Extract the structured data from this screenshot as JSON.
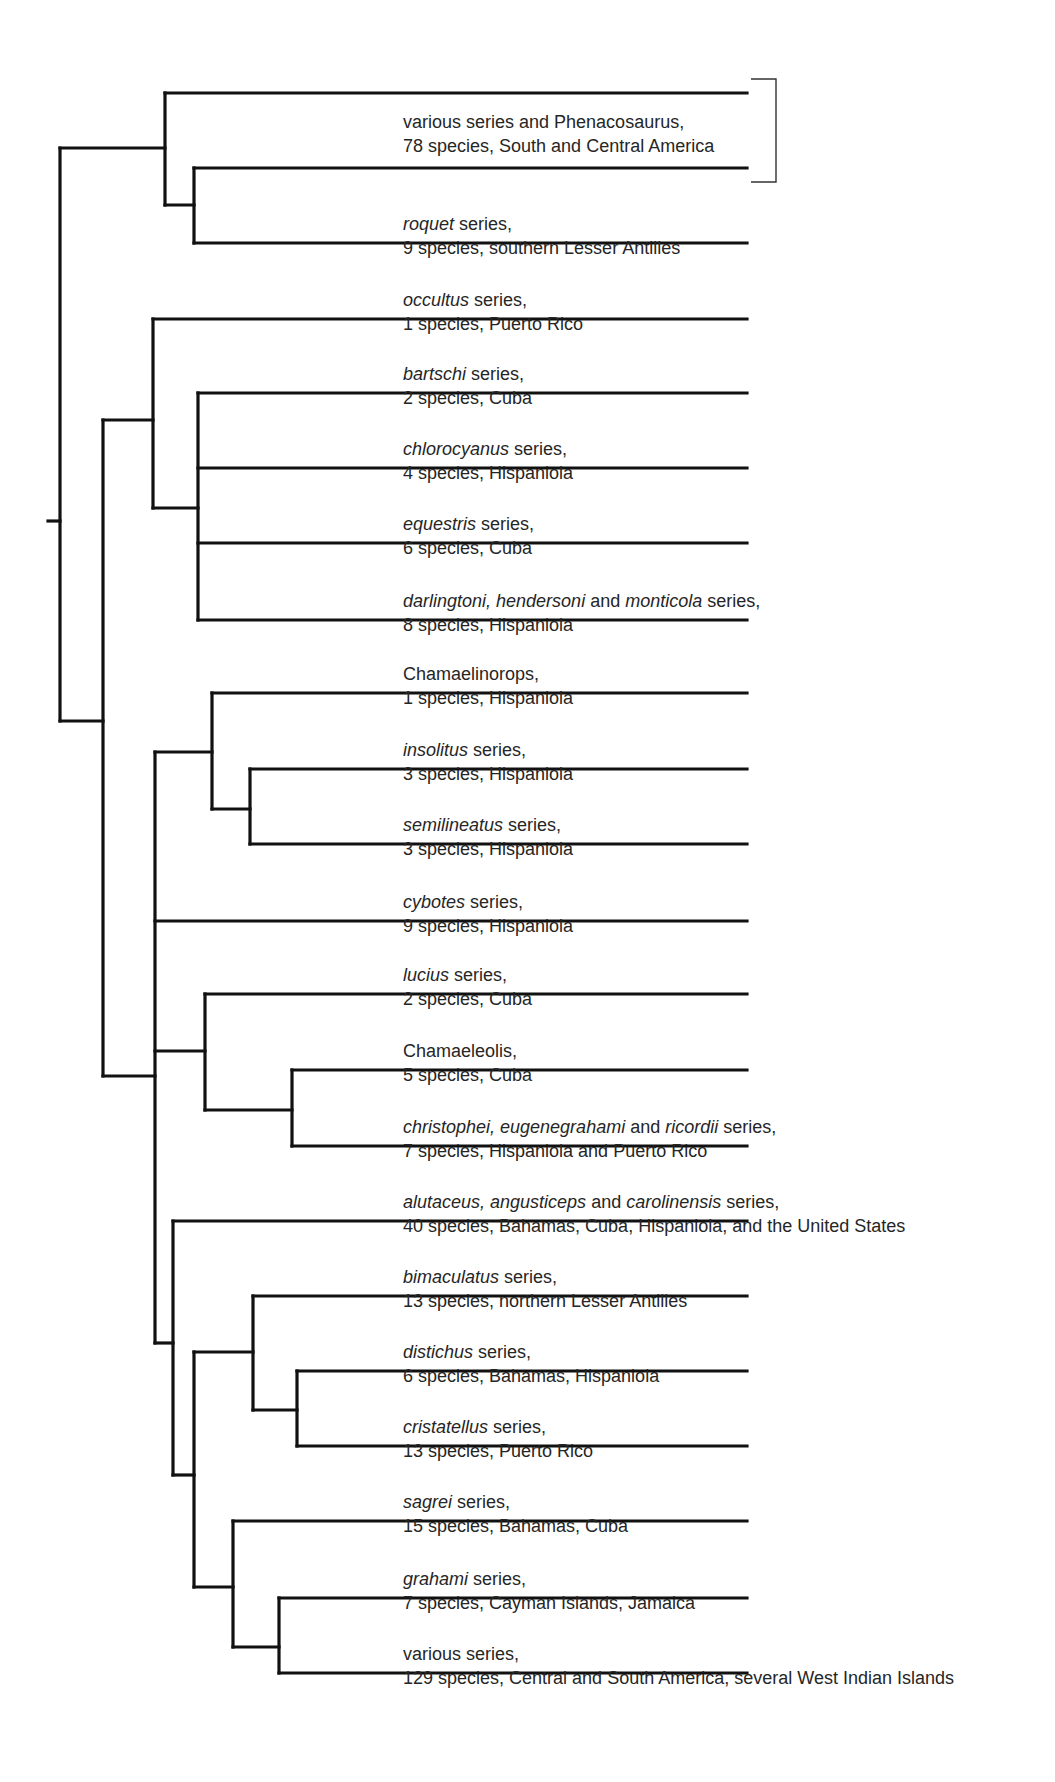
{
  "diagram": {
    "type": "phylogenetic-tree",
    "line_color": "#111111",
    "text_color": "#262626",
    "leaf_end_x": 747,
    "root_stub": {
      "x1": 48,
      "x2": 60,
      "y": 521
    },
    "bracket": {
      "x_left": 751,
      "x_right": 776,
      "y_top": 79,
      "y_bottom": 182,
      "label": "various series and Phenacosaurus clade"
    },
    "nodes": [
      {
        "id": "root",
        "x": 60,
        "y1": 148,
        "y2": 721
      },
      {
        "id": "A",
        "x": 165,
        "y1": 93,
        "y2": 205,
        "parent_x": 60,
        "parent_y": 148
      },
      {
        "id": "B",
        "x": 194,
        "y1": 168,
        "y2": 243,
        "parent_x": 165,
        "parent_y": 205
      },
      {
        "id": "D",
        "x": 103,
        "y1": 420,
        "y2": 1076,
        "parent_x": 60,
        "parent_y": 721
      },
      {
        "id": "C",
        "x": 153,
        "y1": 319,
        "y2": 508,
        "parent_x": 103,
        "parent_y": 420
      },
      {
        "id": "E",
        "x": 198,
        "y1": 393,
        "y2": 620,
        "parent_x": 153,
        "parent_y": 508
      },
      {
        "id": "F",
        "x": 155,
        "y1": 752,
        "y2": 1343,
        "parent_x": 103,
        "parent_y": 1076
      },
      {
        "id": "G",
        "x": 212,
        "y1": 693,
        "y2": 809,
        "parent_x": 155,
        "parent_y": 752
      },
      {
        "id": "H",
        "x": 250,
        "y1": 769,
        "y2": 844,
        "parent_x": 212,
        "parent_y": 809
      },
      {
        "id": "I",
        "x": 205,
        "y1": 994,
        "y2": 1110,
        "parent_x": 155,
        "parent_y": 1051
      },
      {
        "id": "J",
        "x": 292,
        "y1": 1070,
        "y2": 1146,
        "parent_x": 205,
        "parent_y": 1110
      },
      {
        "id": "K",
        "x": 173,
        "y1": 1221,
        "y2": 1475,
        "parent_x": 155,
        "parent_y": 1343
      },
      {
        "id": "M",
        "x": 194,
        "y1": 1352,
        "y2": 1587,
        "parent_x": 173,
        "parent_y": 1475
      },
      {
        "id": "L",
        "x": 253,
        "y1": 1296,
        "y2": 1410,
        "parent_x": 194,
        "parent_y": 1352
      },
      {
        "id": "N",
        "x": 297,
        "y1": 1371,
        "y2": 1446,
        "parent_x": 253,
        "parent_y": 1410
      },
      {
        "id": "O",
        "x": 233,
        "y1": 1521,
        "y2": 1647,
        "parent_x": 194,
        "parent_y": 1587
      },
      {
        "id": "P",
        "x": 279,
        "y1": 1598,
        "y2": 1673,
        "parent_x": 233,
        "parent_y": 1647
      }
    ],
    "leaves": [
      {
        "x": 165,
        "y": 93,
        "label_top": null,
        "line1": null,
        "line2": null
      },
      {
        "x": 194,
        "y": 168,
        "label_top": 110,
        "line1": [
          {
            "t": "various series and Phenacosaurus,",
            "i": false
          }
        ],
        "line2": "78 species, South and Central America"
      },
      {
        "x": 194,
        "y": 243,
        "label_top": 212,
        "line1": [
          {
            "t": "roquet",
            "i": true
          },
          {
            "t": " series,",
            "i": false
          }
        ],
        "line2": "9 species, southern Lesser Antilles"
      },
      {
        "x": 153,
        "y": 319,
        "label_top": 288,
        "line1": [
          {
            "t": "occultus",
            "i": true
          },
          {
            "t": " series,",
            "i": false
          }
        ],
        "line2": "1 species, Puerto Rico"
      },
      {
        "x": 198,
        "y": 393,
        "label_top": 362,
        "line1": [
          {
            "t": "bartschi",
            "i": true
          },
          {
            "t": " series,",
            "i": false
          }
        ],
        "line2": "2 species, Cuba"
      },
      {
        "x": 198,
        "y": 468,
        "label_top": 437,
        "line1": [
          {
            "t": "chlorocyanus",
            "i": true
          },
          {
            "t": " series,",
            "i": false
          }
        ],
        "line2": "4 species, Hispaniola"
      },
      {
        "x": 198,
        "y": 543,
        "label_top": 512,
        "line1": [
          {
            "t": "equestris",
            "i": true
          },
          {
            "t": " series,",
            "i": false
          }
        ],
        "line2": "6 species, Cuba"
      },
      {
        "x": 198,
        "y": 620,
        "label_top": 589,
        "line1": [
          {
            "t": "darlingtoni, hendersoni",
            "i": true
          },
          {
            "t": " and ",
            "i": false
          },
          {
            "t": "monticola",
            "i": true
          },
          {
            "t": " series,",
            "i": false
          }
        ],
        "line2": "8 species, Hispaniola"
      },
      {
        "x": 212,
        "y": 693,
        "label_top": 662,
        "line1": [
          {
            "t": "Chamaelinorops,",
            "i": false
          }
        ],
        "line2": "1 species, Hispaniola"
      },
      {
        "x": 250,
        "y": 769,
        "label_top": 738,
        "line1": [
          {
            "t": "insolitus",
            "i": true
          },
          {
            "t": " series,",
            "i": false
          }
        ],
        "line2": "3 species, Hispaniola"
      },
      {
        "x": 250,
        "y": 844,
        "label_top": 813,
        "line1": [
          {
            "t": "semilineatus",
            "i": true
          },
          {
            "t": " series,",
            "i": false
          }
        ],
        "line2": "3 species, Hispaniola"
      },
      {
        "x": 155,
        "y": 921,
        "label_top": 890,
        "line1": [
          {
            "t": "cybotes",
            "i": true
          },
          {
            "t": " series,",
            "i": false
          }
        ],
        "line2": "9 species, Hispaniola"
      },
      {
        "x": 205,
        "y": 994,
        "label_top": 963,
        "line1": [
          {
            "t": "lucius",
            "i": true
          },
          {
            "t": " series,",
            "i": false
          }
        ],
        "line2": "2 species, Cuba"
      },
      {
        "x": 292,
        "y": 1070,
        "label_top": 1039,
        "line1": [
          {
            "t": "Chamaeleolis,",
            "i": false
          }
        ],
        "line2": "5 species, Cuba"
      },
      {
        "x": 292,
        "y": 1146,
        "label_top": 1115,
        "line1": [
          {
            "t": "christophei, eugenegrahami",
            "i": true
          },
          {
            "t": " and ",
            "i": false
          },
          {
            "t": "ricordii",
            "i": true
          },
          {
            "t": " series,",
            "i": false
          }
        ],
        "line2": "7 species, Hispaniola and Puerto Rico"
      },
      {
        "x": 173,
        "y": 1221,
        "label_top": 1190,
        "line1": [
          {
            "t": "alutaceus, angusticeps",
            "i": true
          },
          {
            "t": " and ",
            "i": false
          },
          {
            "t": "carolinensis",
            "i": true
          },
          {
            "t": " series,",
            "i": false
          }
        ],
        "line2": "40 species, Bahamas, Cuba, Hispaniola, and the United States"
      },
      {
        "x": 253,
        "y": 1296,
        "label_top": 1265,
        "line1": [
          {
            "t": "bimaculatus",
            "i": true
          },
          {
            "t": " series,",
            "i": false
          }
        ],
        "line2": "13 species, northern Lesser Antilles"
      },
      {
        "x": 297,
        "y": 1371,
        "label_top": 1340,
        "line1": [
          {
            "t": "distichus",
            "i": true
          },
          {
            "t": " series,",
            "i": false
          }
        ],
        "line2": "6 species, Bahamas, Hispaniola"
      },
      {
        "x": 297,
        "y": 1446,
        "label_top": 1415,
        "line1": [
          {
            "t": "cristatellus",
            "i": true
          },
          {
            "t": " series,",
            "i": false
          }
        ],
        "line2": "13 species, Puerto Rico"
      },
      {
        "x": 233,
        "y": 1521,
        "label_top": 1490,
        "line1": [
          {
            "t": "sagrei",
            "i": true
          },
          {
            "t": " series,",
            "i": false
          }
        ],
        "line2": "15 species, Bahamas, Cuba"
      },
      {
        "x": 279,
        "y": 1598,
        "label_top": 1567,
        "line1": [
          {
            "t": "grahami",
            "i": true
          },
          {
            "t": " series,",
            "i": false
          }
        ],
        "line2": "7 species, Cayman Islands, Jamaica"
      },
      {
        "x": 279,
        "y": 1673,
        "label_top": 1642,
        "line1": [
          {
            "t": "various series,",
            "i": false
          }
        ],
        "line2": "129 species, Central and South America, several West Indian Islands"
      }
    ]
  }
}
